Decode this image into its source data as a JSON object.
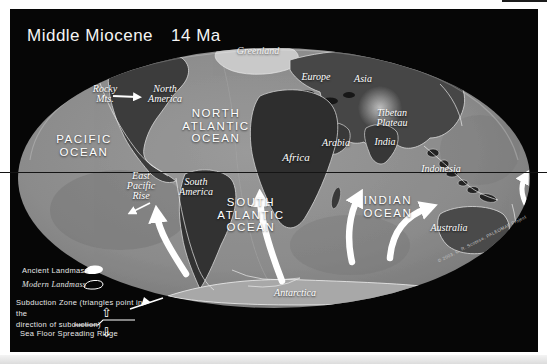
{
  "title": {
    "era": "Middle Miocene",
    "age": "14 Ma"
  },
  "colors": {
    "background": "#060606",
    "page": "#ffffff",
    "ocean": "#8b8b8b",
    "land_dark": "#353535",
    "ancient_landmass": "#cfcfcf",
    "arrow": "#ffffff",
    "text": "#ffffff"
  },
  "ocean_labels": [
    {
      "id": "pacific-ocean",
      "text": "PACIFIC\nOCEAN"
    },
    {
      "id": "north-atlantic-ocean",
      "text": "NORTH\nATLANTIC\nOCEAN"
    },
    {
      "id": "south-atlantic-ocean",
      "text": "SOUTH\nATLANTIC\nOCEAN"
    },
    {
      "id": "indian-ocean",
      "text": "INDIAN\nOCEAN"
    }
  ],
  "place_labels": [
    {
      "id": "greenland",
      "text": "Greenland"
    },
    {
      "id": "rocky-mts",
      "text": "Rocky\nMts."
    },
    {
      "id": "north-america",
      "text": "North\nAmerica"
    },
    {
      "id": "europe",
      "text": "Europe"
    },
    {
      "id": "asia",
      "text": "Asia"
    },
    {
      "id": "tibetan-plateau",
      "text": "Tibetan\nPlateau"
    },
    {
      "id": "arabia",
      "text": "Arabia"
    },
    {
      "id": "india",
      "text": "India"
    },
    {
      "id": "africa",
      "text": "Africa"
    },
    {
      "id": "east-pacific-rise",
      "text": "East\nPacific\nRise"
    },
    {
      "id": "south-america",
      "text": "South\nAmerica"
    },
    {
      "id": "indonesia",
      "text": "Indonesia"
    },
    {
      "id": "australia",
      "text": "Australia"
    },
    {
      "id": "antarctica",
      "text": "Antarctica"
    }
  ],
  "legend": {
    "ancient_landmass": "Ancient Landmass",
    "modern_landmass": "Modern Landmass",
    "subduction_zone": "Subduction Zone (triangles point in the\ndirection of subduction)",
    "sea_floor_spreading_ridge": "Sea Floor Spreading Ridge",
    "up_arrow": "⇧",
    "down_arrow": "⇩"
  },
  "credit": "© 2003, C. R. Scotese, PALEOMAP Project"
}
